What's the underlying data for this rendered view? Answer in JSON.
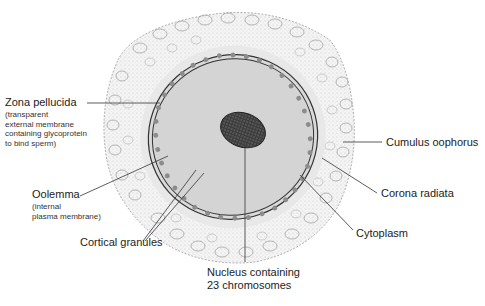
{
  "diagram": {
    "colors": {
      "background": "#ffffff",
      "cumulus_fill": "#f2f2f2",
      "cumulus_stroke": "#9a9a9a",
      "corona_fill": "#e6e6e6",
      "zona_stroke": "#333333",
      "cytoplasm_fill": "#d4d4d4",
      "granule_fill": "#8c8c8c",
      "nucleus_fill": "#5a5a5a",
      "leader_line": "#333333",
      "label_text": "#222222"
    },
    "labels": {
      "zona_pellucida": {
        "title": "Zona pellucida",
        "desc_lines": [
          "(transparent",
          "external membrane",
          "containing glycoprotein",
          "to bind sperm)"
        ]
      },
      "oolemma": {
        "title": "Oolemma",
        "desc_lines": [
          "(internal",
          "plasma membrane)"
        ]
      },
      "cortical_granules": {
        "title": "Cortical granules"
      },
      "nucleus": {
        "lines": [
          "Nucleus containing",
          "23 chromosomes"
        ]
      },
      "cytoplasm": {
        "title": "Cytoplasm"
      },
      "corona_radiata": {
        "title": "Corona radiata"
      },
      "cumulus_oophorus": {
        "title": "Cumulus oophorus"
      }
    }
  }
}
